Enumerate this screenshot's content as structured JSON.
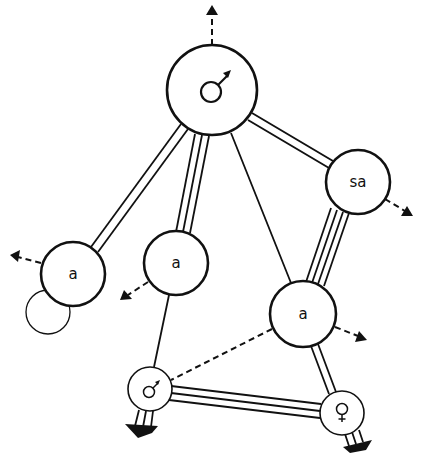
{
  "diagram": {
    "title": "",
    "colors": {
      "stroke": "#111111",
      "fill": "#ffffff"
    },
    "nodes": [
      {
        "id": "top-male",
        "label": "",
        "symbol": "male-symbol",
        "cx": 212,
        "cy": 90,
        "r": 45
      },
      {
        "id": "sa",
        "label": "sa",
        "cx": 358,
        "cy": 182,
        "r": 32
      },
      {
        "id": "left-a",
        "label": "a",
        "cx": 73,
        "cy": 274,
        "r": 32
      },
      {
        "id": "small-circle",
        "label": "",
        "cx": 48,
        "cy": 312,
        "r": 22,
        "thin": true
      },
      {
        "id": "middle-a",
        "label": "a",
        "cx": 176,
        "cy": 263,
        "r": 32
      },
      {
        "id": "right-a",
        "label": "a",
        "cx": 303,
        "cy": 314,
        "r": 33
      },
      {
        "id": "bottom-male",
        "label": "",
        "symbol": "male-symbol",
        "cx": 150,
        "cy": 389,
        "r": 22
      },
      {
        "id": "female",
        "label": "",
        "symbol": "female-symbol",
        "cx": 342,
        "cy": 413,
        "r": 22
      }
    ],
    "edges": [
      {
        "from": "top-male",
        "to": "left-a",
        "lines": 2,
        "style": "solid"
      },
      {
        "from": "top-male",
        "to": "middle-a",
        "lines": 3,
        "style": "solid"
      },
      {
        "from": "top-male",
        "to": "right-a",
        "lines": 1,
        "style": "solid"
      },
      {
        "from": "top-male",
        "to": "sa",
        "lines": 2,
        "style": "solid"
      },
      {
        "from": "sa",
        "to": "right-a",
        "lines": 4,
        "style": "solid"
      },
      {
        "from": "middle-a",
        "to": "bottom-male",
        "lines": 1,
        "style": "solid"
      },
      {
        "from": "right-a",
        "to": "bottom-male",
        "lines": 1,
        "style": "dashed"
      },
      {
        "from": "right-a",
        "to": "female",
        "lines": 2,
        "style": "solid"
      },
      {
        "from": "bottom-male",
        "to": "female",
        "lines": 3,
        "style": "solid"
      }
    ],
    "outgoing_dashed_arrows": [
      {
        "from": "top-male",
        "direction": "up"
      },
      {
        "from": "sa",
        "direction": "down-right"
      },
      {
        "from": "left-a",
        "direction": "left"
      },
      {
        "from": "middle-a",
        "direction": "down-left"
      },
      {
        "from": "right-a",
        "direction": "right"
      }
    ],
    "outgoing_heavy_arrows": [
      {
        "from": "bottom-male",
        "lines": 3,
        "direction": "down"
      },
      {
        "from": "female",
        "lines": 3,
        "direction": "down"
      }
    ]
  }
}
